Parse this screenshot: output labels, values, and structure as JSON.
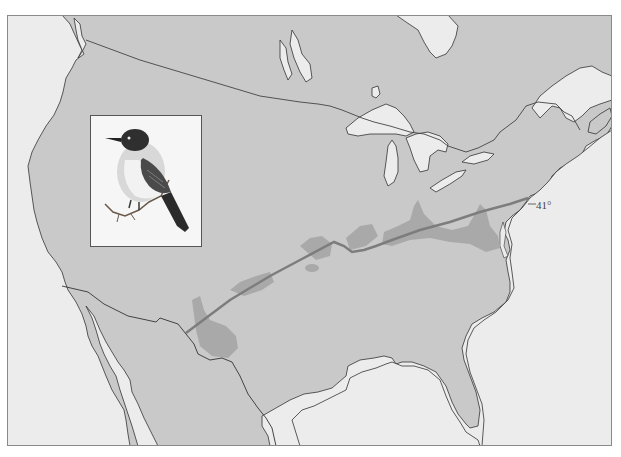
{
  "map": {
    "title": "Breeding range map with latitude line",
    "latitude_label": "41°",
    "colors": {
      "land": "#c9c9c9",
      "water": "#ececec",
      "range_band": "#a9a9a9",
      "latitude_line": "#7d7d7d",
      "coastline": "#333333"
    },
    "regions": [
      "Canada",
      "United States",
      "Mexico",
      "Great Lakes",
      "Gulf of Mexico",
      "Atlantic Ocean",
      "Pacific Ocean"
    ]
  },
  "inset": {
    "subject": "bird illustration (flycatcher perched on twig)",
    "icon": "bird-icon"
  }
}
